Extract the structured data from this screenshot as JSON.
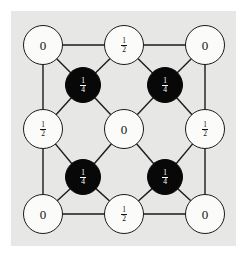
{
  "figure": {
    "background_color": "#ffffff",
    "panel_color": "#e7e7e5",
    "edge_color": "#1a1a1a",
    "white_node_fill": "#fbfbfa",
    "black_node_fill": "#080808",
    "white_node_label_color": "#111111",
    "black_node_label_color": "#ffffff"
  },
  "nodes": [
    {
      "id": "n-top-left",
      "kind": "white",
      "value_type": "integer",
      "value": "0",
      "cx": 43,
      "cy": 45,
      "r": 20
    },
    {
      "id": "n-top-mid",
      "kind": "white",
      "value_type": "fraction",
      "num": "1",
      "den": "2",
      "cx": 124,
      "cy": 45,
      "r": 20
    },
    {
      "id": "n-top-right",
      "kind": "white",
      "value_type": "integer",
      "value": "0",
      "cx": 205,
      "cy": 45,
      "r": 20
    },
    {
      "id": "n-inner-top-left",
      "kind": "black",
      "value_type": "fraction",
      "num": "1",
      "den": "4",
      "cx": 83,
      "cy": 85,
      "r": 18
    },
    {
      "id": "n-inner-top-right",
      "kind": "black",
      "value_type": "fraction",
      "num": "1",
      "den": "4",
      "cx": 165,
      "cy": 85,
      "r": 18
    },
    {
      "id": "n-mid-left",
      "kind": "white",
      "value_type": "fraction",
      "num": "1",
      "den": "2",
      "cx": 43,
      "cy": 129,
      "r": 20
    },
    {
      "id": "n-center",
      "kind": "white",
      "value_type": "integer",
      "value": "0",
      "cx": 124,
      "cy": 129,
      "r": 20
    },
    {
      "id": "n-mid-right",
      "kind": "white",
      "value_type": "fraction",
      "num": "1",
      "den": "2",
      "cx": 205,
      "cy": 129,
      "r": 20
    },
    {
      "id": "n-inner-bot-left",
      "kind": "black",
      "value_type": "fraction",
      "num": "1",
      "den": "4",
      "cx": 83,
      "cy": 177,
      "r": 18
    },
    {
      "id": "n-inner-bot-right",
      "kind": "black",
      "value_type": "fraction",
      "num": "1",
      "den": "4",
      "cx": 165,
      "cy": 177,
      "r": 18
    },
    {
      "id": "n-bot-left",
      "kind": "white",
      "value_type": "integer",
      "value": "0",
      "cx": 43,
      "cy": 214,
      "r": 20
    },
    {
      "id": "n-bot-mid",
      "kind": "white",
      "value_type": "fraction",
      "num": "1",
      "den": "2",
      "cx": 124,
      "cy": 214,
      "r": 20
    },
    {
      "id": "n-bot-right",
      "kind": "white",
      "value_type": "integer",
      "value": "0",
      "cx": 205,
      "cy": 214,
      "r": 20
    }
  ],
  "edges": [
    {
      "from": "n-top-left",
      "to": "n-top-mid"
    },
    {
      "from": "n-top-mid",
      "to": "n-top-right"
    },
    {
      "from": "n-bot-left",
      "to": "n-bot-mid"
    },
    {
      "from": "n-bot-mid",
      "to": "n-bot-right"
    },
    {
      "from": "n-top-left",
      "to": "n-mid-left"
    },
    {
      "from": "n-mid-left",
      "to": "n-bot-left"
    },
    {
      "from": "n-top-right",
      "to": "n-mid-right"
    },
    {
      "from": "n-mid-right",
      "to": "n-bot-right"
    },
    {
      "from": "n-top-left",
      "to": "n-inner-top-left"
    },
    {
      "from": "n-top-mid",
      "to": "n-inner-top-left"
    },
    {
      "from": "n-mid-left",
      "to": "n-inner-top-left"
    },
    {
      "from": "n-center",
      "to": "n-inner-top-left"
    },
    {
      "from": "n-top-mid",
      "to": "n-inner-top-right"
    },
    {
      "from": "n-top-right",
      "to": "n-inner-top-right"
    },
    {
      "from": "n-center",
      "to": "n-inner-top-right"
    },
    {
      "from": "n-mid-right",
      "to": "n-inner-top-right"
    },
    {
      "from": "n-mid-left",
      "to": "n-inner-bot-left"
    },
    {
      "from": "n-center",
      "to": "n-inner-bot-left"
    },
    {
      "from": "n-bot-left",
      "to": "n-inner-bot-left"
    },
    {
      "from": "n-bot-mid",
      "to": "n-inner-bot-left"
    },
    {
      "from": "n-center",
      "to": "n-inner-bot-right"
    },
    {
      "from": "n-mid-right",
      "to": "n-inner-bot-right"
    },
    {
      "from": "n-bot-mid",
      "to": "n-inner-bot-right"
    },
    {
      "from": "n-bot-right",
      "to": "n-inner-bot-right"
    }
  ]
}
